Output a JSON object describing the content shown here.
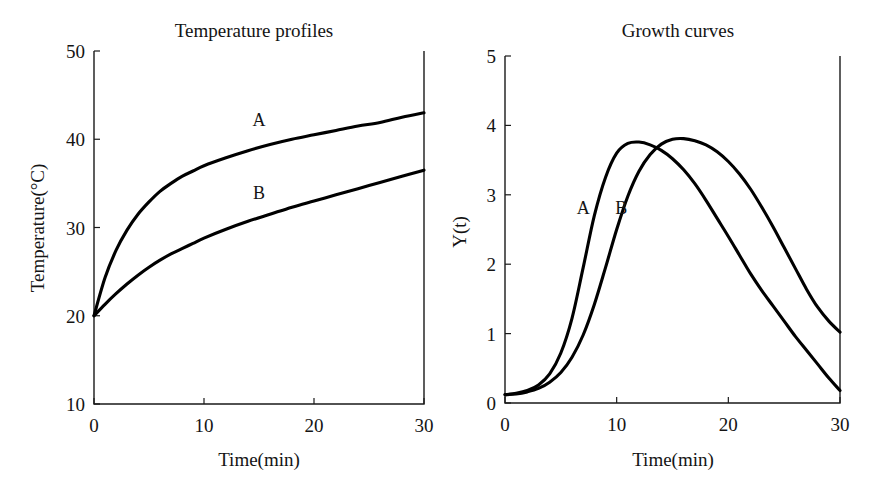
{
  "figure": {
    "background": "#ffffff",
    "ink_color": "#000000",
    "width": 878,
    "height": 489
  },
  "chart_data": [
    {
      "id": "temperature-profiles",
      "type": "line",
      "title": "Temperature profiles",
      "xlabel": "Time(min)",
      "ylabel": "Temperature(°C)",
      "xlim": [
        0,
        30
      ],
      "ylim": [
        10,
        50
      ],
      "xticks": [
        0,
        10,
        20,
        30
      ],
      "yticks": [
        10,
        20,
        30,
        40,
        50
      ],
      "xticklabels": [
        "0",
        "10",
        "20",
        "30"
      ],
      "yticklabels": [
        "10",
        "20",
        "30",
        "40",
        "50"
      ],
      "grid": false,
      "legend": "inline-curve-labels",
      "x": [
        0,
        1,
        2,
        3,
        4,
        5,
        6,
        7,
        8,
        9,
        10,
        12,
        14,
        16,
        18,
        20,
        22,
        24,
        26,
        28,
        30
      ],
      "series": [
        {
          "name": "A",
          "label": "A",
          "label_at": {
            "x": 15.0,
            "y": 41.5
          },
          "values": [
            20.0,
            24.3,
            27.4,
            29.7,
            31.5,
            32.9,
            34.1,
            35.0,
            35.8,
            36.4,
            37.0,
            37.9,
            38.7,
            39.4,
            40.0,
            40.5,
            41.0,
            41.5,
            41.9,
            42.5,
            43.0
          ]
        },
        {
          "name": "B",
          "label": "B",
          "label_at": {
            "x": 15.0,
            "y": 33.2
          },
          "values": [
            20.0,
            21.3,
            22.5,
            23.6,
            24.6,
            25.5,
            26.3,
            27.0,
            27.6,
            28.2,
            28.8,
            29.8,
            30.7,
            31.5,
            32.3,
            33.0,
            33.7,
            34.4,
            35.1,
            35.8,
            36.5
          ]
        }
      ]
    },
    {
      "id": "growth-curves",
      "type": "line",
      "title": "Growth curves",
      "xlabel": "Time(min)",
      "ylabel": "Y(t)",
      "xlim": [
        0,
        30
      ],
      "ylim": [
        0,
        5
      ],
      "xticks": [
        0,
        10,
        20,
        30
      ],
      "yticks": [
        0,
        1,
        2,
        3,
        4,
        5
      ],
      "xticklabels": [
        "0",
        "10",
        "20",
        "30"
      ],
      "yticklabels": [
        "0",
        "1",
        "2",
        "3",
        "4",
        "5"
      ],
      "grid": false,
      "legend": "inline-curve-labels",
      "x": [
        0,
        1,
        2,
        3,
        4,
        5,
        6,
        7,
        8,
        9,
        10,
        11,
        12,
        13,
        14,
        15,
        16,
        17,
        18,
        19,
        20,
        21,
        22,
        23,
        24,
        25,
        26,
        27,
        28,
        29,
        30
      ],
      "series": [
        {
          "name": "A",
          "label": "A",
          "label_at": {
            "x": 7.0,
            "y": 2.72
          },
          "values": [
            0.12,
            0.14,
            0.18,
            0.26,
            0.42,
            0.72,
            1.22,
            1.95,
            2.7,
            3.25,
            3.6,
            3.74,
            3.76,
            3.72,
            3.64,
            3.52,
            3.36,
            3.16,
            2.92,
            2.66,
            2.4,
            2.13,
            1.86,
            1.62,
            1.4,
            1.18,
            0.96,
            0.76,
            0.56,
            0.36,
            0.18
          ]
        },
        {
          "name": "B",
          "label": "B",
          "label_at": {
            "x": 10.4,
            "y": 2.72
          },
          "values": [
            0.12,
            0.13,
            0.16,
            0.21,
            0.3,
            0.44,
            0.66,
            0.98,
            1.42,
            1.95,
            2.5,
            2.98,
            3.34,
            3.58,
            3.73,
            3.8,
            3.81,
            3.78,
            3.72,
            3.62,
            3.48,
            3.3,
            3.08,
            2.82,
            2.54,
            2.24,
            1.94,
            1.64,
            1.38,
            1.18,
            1.02
          ]
        }
      ]
    }
  ],
  "panels": [
    {
      "name": "temperature-panel",
      "plot_box": {
        "x": 94,
        "y": 51,
        "width": 330,
        "height": 353
      }
    },
    {
      "name": "growth-panel",
      "plot_box": {
        "x": 67,
        "y": 56,
        "width": 335,
        "height": 347
      }
    }
  ]
}
